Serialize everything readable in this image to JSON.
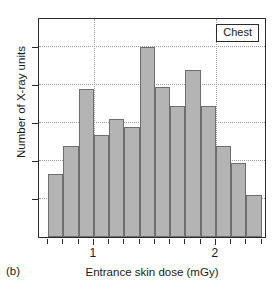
{
  "panel": {
    "label": "(b)"
  },
  "legend": {
    "text": "Chest"
  },
  "colors": {
    "bar_fill": "#b4b4b4",
    "bar_edge": "#6e6e6e",
    "axis": "#2b2b2b",
    "grid": "#9a9a9a",
    "background": "#ffffff"
  },
  "chart_data": {
    "type": "bar",
    "title": "",
    "subtitle": "",
    "xlabel": "Entrance skin dose (mGy)",
    "ylabel": "Number of X-ray units",
    "legend_entries": [
      "Chest"
    ],
    "legend_position": "top-right",
    "grid": true,
    "grid_axis": "both",
    "xlim": [
      0.55,
      2.42
    ],
    "ylim": [
      0,
      11.6
    ],
    "bin_width": 0.125,
    "x_major_ticks": [
      1,
      2
    ],
    "x_major_ticklabels": [
      "1",
      "2"
    ],
    "x_minor_ticks": [
      0.625,
      0.75,
      0.875,
      1.125,
      1.25,
      1.375,
      1.5,
      1.625,
      1.75,
      1.875,
      2.125,
      2.25,
      2.375
    ],
    "y_gridlines": [
      2,
      4,
      6,
      8,
      10
    ],
    "y_ticklabels": [],
    "categories": [
      "0.625",
      "0.750",
      "0.875",
      "1.000",
      "1.125",
      "1.250",
      "1.375",
      "1.500",
      "1.625",
      "1.750",
      "1.875",
      "2.000",
      "2.125",
      "2.250"
    ],
    "bin_left_edges": [
      0.625,
      0.75,
      0.875,
      1.0,
      1.125,
      1.25,
      1.375,
      1.5,
      1.625,
      1.75,
      1.875,
      2.0,
      2.125,
      2.25
    ],
    "values": [
      3.3,
      4.8,
      7.8,
      5.4,
      6.2,
      5.8,
      10.0,
      7.9,
      6.9,
      8.8,
      6.9,
      4.8,
      3.9,
      2.2
    ],
    "series": [
      {
        "name": "Chest",
        "values": [
          3.3,
          4.8,
          7.8,
          5.4,
          6.2,
          5.8,
          10.0,
          7.9,
          6.9,
          8.8,
          6.9,
          4.8,
          3.9,
          2.2
        ]
      }
    ]
  }
}
